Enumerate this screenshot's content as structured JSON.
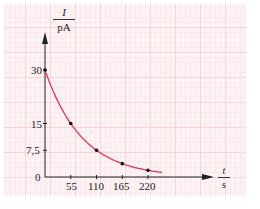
{
  "chart_data": {
    "type": "line",
    "title": "",
    "xlabel": "t / s",
    "ylabel": "I / pA",
    "x_axis": {
      "symbol": "t",
      "unit": "s",
      "ticks": [
        55,
        110,
        165,
        220
      ],
      "range": [
        0,
        330
      ]
    },
    "y_axis": {
      "symbol": "I",
      "unit": "pA",
      "ticks": [
        0,
        7.5,
        15,
        30
      ],
      "tick_labels": [
        "0",
        "7,5",
        "15",
        "30"
      ],
      "range": [
        0,
        36
      ]
    },
    "grid": true,
    "grid_color": "#f3c9d0",
    "curve_color": "#e0405f",
    "series": [
      {
        "name": "I(t)",
        "x": [
          0,
          55,
          110,
          165,
          220
        ],
        "y": [
          30,
          15,
          7.5,
          3.75,
          1.9
        ]
      }
    ],
    "curve_end_x": 250,
    "legend": null
  },
  "labels": {
    "y_symbol": "I",
    "y_unit": "pA",
    "x_symbol": "t",
    "x_unit": "s",
    "origin": "0",
    "y_ticks": [
      "30",
      "15",
      "7,5"
    ],
    "x_ticks": [
      "55",
      "110",
      "165",
      "220"
    ]
  }
}
